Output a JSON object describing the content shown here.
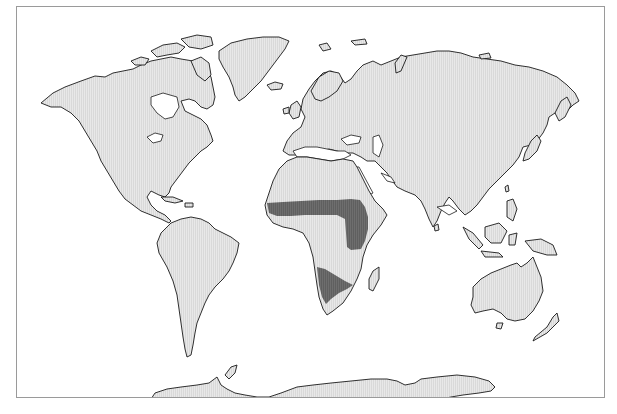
{
  "map": {
    "type": "world distribution map",
    "projection": "equirectangular-like world map",
    "colors": {
      "land": "#e6e6e6",
      "land_texture": "#d6d6d6",
      "coastline": "#1a1a1a",
      "ocean": "#ffffff",
      "highlighted_range": "#6e6e6e",
      "frame_border": "#9a9a9a"
    },
    "highlighted_regions": [
      {
        "name": "sahel-band",
        "description": "Band across sub-Saharan Africa from West African coast to Horn of Africa, extending south through East Africa"
      },
      {
        "name": "southern-africa",
        "description": "Triangular region over southwestern Africa (Namibia / Botswana / Angola area)"
      }
    ],
    "continents": [
      "North America",
      "Greenland",
      "South America",
      "Europe",
      "Africa",
      "Asia",
      "Australia",
      "New Zealand",
      "Antarctica",
      "Madagascar",
      "Japan",
      "Indonesia",
      "Philippines",
      "British Isles",
      "Iceland"
    ]
  }
}
